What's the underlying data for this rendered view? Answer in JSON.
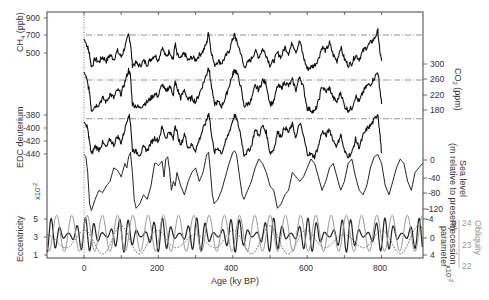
{
  "chart_data": {
    "type": "line",
    "title": "",
    "xlabel": "Age (ky BP)",
    "xlim": [
      -100,
      910
    ],
    "xticks": [
      0,
      200,
      400,
      600,
      800
    ],
    "x_minor_ticks": [
      100,
      300,
      500,
      700
    ],
    "grid": false,
    "panels": [
      {
        "name": "CH4",
        "ylabel": "CH4 (ppb)",
        "axis_side": "left",
        "yticks": [
          500,
          700,
          900
        ],
        "ylim": [
          350,
          950
        ],
        "reference_line": 720,
        "series": [
          {
            "name": "CH4",
            "color": "#111111",
            "x": [
              0,
              5,
              10,
              15,
              20,
              30,
              40,
              50,
              60,
              70,
              80,
              90,
              100,
              110,
              120,
              125,
              130,
              140,
              150,
              160,
              170,
              180,
              190,
              200,
              210,
              220,
              230,
              240,
              245,
              250,
              260,
              270,
              280,
              290,
              300,
              310,
              320,
              330,
              335,
              340,
              350,
              360,
              370,
              380,
              390,
              400,
              405,
              410,
              420,
              430,
              440,
              450,
              460,
              470,
              480,
              490,
              500,
              510,
              520,
              530,
              540,
              550,
              560,
              570,
              580,
              590,
              600,
              610,
              620,
              630,
              640,
              650,
              660,
              670,
              680,
              690,
              700,
              710,
              720,
              730,
              740,
              750,
              760,
              770,
              780,
              790,
              795,
              800
            ],
            "values": [
              680,
              640,
              600,
              520,
              400,
              480,
              450,
              500,
              460,
              520,
              480,
              560,
              500,
              600,
              720,
              640,
              420,
              440,
              410,
              460,
              430,
              480,
              520,
              470,
              600,
              500,
              560,
              480,
              640,
              520,
              480,
              540,
              460,
              500,
              470,
              520,
              560,
              640,
              760,
              600,
              420,
              460,
              440,
              500,
              560,
              680,
              720,
              660,
              560,
              400,
              440,
              480,
              560,
              500,
              580,
              520,
              420,
              460,
              540,
              500,
              600,
              540,
              640,
              560,
              660,
              500,
              380,
              400,
              420,
              480,
              600,
              560,
              640,
              520,
              460,
              600,
              480,
              420,
              440,
              520,
              480,
              560,
              600,
              640,
              680,
              760,
              560,
              460
            ]
          }
        ]
      },
      {
        "name": "CO2",
        "ylabel": "CO2 (ppm)",
        "axis_side": "right",
        "yticks": [
          180,
          220,
          260,
          300
        ],
        "ylim": [
          165,
          310
        ],
        "reference_line": 260,
        "series": [
          {
            "name": "CO2",
            "color": "#111111",
            "x": [
              0,
              5,
              10,
              15,
              20,
              30,
              40,
              50,
              60,
              70,
              80,
              90,
              100,
              110,
              120,
              125,
              130,
              140,
              150,
              160,
              170,
              180,
              190,
              200,
              210,
              220,
              230,
              240,
              245,
              250,
              260,
              270,
              280,
              290,
              300,
              310,
              320,
              330,
              335,
              340,
              350,
              360,
              370,
              380,
              390,
              400,
              405,
              410,
              420,
              430,
              440,
              450,
              460,
              470,
              480,
              490,
              500,
              510,
              520,
              530,
              540,
              550,
              560,
              570,
              580,
              590,
              600,
              610,
              620,
              630,
              640,
              650,
              660,
              670,
              680,
              690,
              700,
              710,
              720,
              730,
              740,
              750,
              760,
              770,
              780,
              790,
              795,
              800
            ],
            "values": [
              280,
              270,
              250,
              230,
              185,
              195,
              200,
              215,
              205,
              225,
              215,
              235,
              225,
              255,
              285,
              270,
              200,
              195,
              190,
              200,
              205,
              215,
              225,
              220,
              250,
              230,
              245,
              225,
              255,
              240,
              215,
              235,
              210,
              215,
              205,
              225,
              250,
              275,
              295,
              260,
              200,
              205,
              195,
              215,
              245,
              275,
              285,
              280,
              250,
              195,
              200,
              210,
              245,
              235,
              260,
              250,
              200,
              205,
              245,
              240,
              255,
              245,
              260,
              235,
              270,
              240,
              190,
              185,
              180,
              205,
              245,
              230,
              240,
              215,
              205,
              230,
              195,
              185,
              190,
              220,
              205,
              230,
              245,
              250,
              265,
              280,
              240,
              200
            ]
          }
        ]
      },
      {
        "name": "EDC deuterium",
        "ylabel": "EDC deuterium",
        "axis_side": "left",
        "yticks": [
          -440,
          -420,
          -400,
          -380
        ],
        "ylim": [
          -450,
          -370
        ],
        "reference_line": -390,
        "series": [
          {
            "name": "dD",
            "color": "#111111",
            "x": [
              0,
              5,
              10,
              15,
              20,
              30,
              40,
              50,
              60,
              70,
              80,
              90,
              100,
              110,
              120,
              125,
              130,
              140,
              150,
              160,
              170,
              180,
              190,
              200,
              210,
              220,
              230,
              240,
              245,
              250,
              260,
              270,
              280,
              290,
              300,
              310,
              320,
              330,
              335,
              340,
              350,
              360,
              370,
              380,
              390,
              400,
              405,
              410,
              420,
              430,
              440,
              450,
              460,
              470,
              480,
              490,
              500,
              510,
              520,
              530,
              540,
              550,
              560,
              570,
              580,
              590,
              600,
              610,
              620,
              630,
              640,
              650,
              660,
              670,
              680,
              690,
              700,
              710,
              720,
              730,
              740,
              750,
              760,
              770,
              780,
              790,
              795,
              800
            ],
            "values": [
              -395,
              -398,
              -405,
              -425,
              -442,
              -430,
              -435,
              -425,
              -432,
              -420,
              -428,
              -415,
              -425,
              -405,
              -383,
              -395,
              -435,
              -438,
              -442,
              -432,
              -436,
              -425,
              -418,
              -422,
              -402,
              -418,
              -408,
              -420,
              -398,
              -410,
              -430,
              -412,
              -432,
              -428,
              -436,
              -420,
              -405,
              -392,
              -380,
              -400,
              -440,
              -432,
              -440,
              -425,
              -410,
              -392,
              -385,
              -390,
              -410,
              -442,
              -438,
              -430,
              -405,
              -415,
              -400,
              -410,
              -440,
              -435,
              -410,
              -415,
              -402,
              -410,
              -398,
              -418,
              -395,
              -415,
              -440,
              -442,
              -445,
              -430,
              -408,
              -415,
              -405,
              -422,
              -430,
              -412,
              -438,
              -444,
              -440,
              -420,
              -432,
              -415,
              -405,
              -400,
              -392,
              -382,
              -410,
              -440
            ]
          }
        ]
      },
      {
        "name": "Sea level",
        "ylabel": "Sea level (m relative to present)",
        "axis_side": "right",
        "yticks": [
          -120,
          -80,
          -40,
          0
        ],
        "ylim": [
          -135,
          10
        ],
        "series": [
          {
            "name": "Sea level",
            "color": "#222222",
            "x": [
              0,
              5,
              10,
              15,
              20,
              30,
              40,
              50,
              60,
              70,
              80,
              90,
              100,
              110,
              115,
              120,
              125,
              130,
              135,
              140,
              150,
              160,
              170,
              180,
              190,
              195,
              200,
              210,
              215,
              220,
              225,
              230,
              235,
              240,
              245,
              250,
              260,
              270,
              280,
              290,
              300,
              310,
              320,
              325,
              330,
              335,
              340,
              345,
              350,
              360,
              370,
              380,
              390,
              400,
              405,
              410,
              415,
              420,
              425,
              430,
              440,
              450,
              460,
              470,
              480,
              490,
              500,
              510,
              520,
              530,
              540,
              550,
              560,
              570,
              580,
              590,
              600,
              610,
              620,
              630,
              640,
              650,
              660,
              670,
              680,
              690,
              700,
              710,
              720,
              730,
              740,
              750,
              760,
              770,
              780,
              790,
              800,
              810,
              820,
              830,
              840,
              850,
              860,
              870,
              880,
              890,
              900,
              910
            ],
            "values": [
              0,
              -5,
              -40,
              -110,
              -125,
              -100,
              -80,
              -85,
              -70,
              -60,
              -30,
              -35,
              -50,
              -20,
              -30,
              -5,
              5,
              -40,
              -100,
              -120,
              -110,
              -90,
              -100,
              -70,
              -20,
              -20,
              -25,
              -15,
              -50,
              -10,
              -5,
              -35,
              -80,
              -60,
              -70,
              -40,
              -70,
              -90,
              -60,
              -40,
              -30,
              -60,
              -40,
              -20,
              0,
              5,
              -40,
              -90,
              -110,
              -100,
              -80,
              -50,
              -20,
              5,
              8,
              0,
              -30,
              -60,
              -90,
              -100,
              -80,
              -60,
              -30,
              -10,
              -20,
              -40,
              -70,
              -80,
              -120,
              -110,
              -90,
              -80,
              -40,
              -50,
              -60,
              -50,
              -30,
              -10,
              -20,
              -50,
              -80,
              -60,
              -30,
              -20,
              -50,
              -80,
              -60,
              -20,
              -10,
              -50,
              -80,
              -90,
              -70,
              -30,
              -5,
              0,
              -20,
              -70,
              -90,
              -60,
              -30,
              -10,
              -20,
              -60,
              -80,
              -40,
              -30,
              -20
            ]
          }
        ]
      },
      {
        "name": "Orbital parameters",
        "axis_side": "both",
        "axes": [
          {
            "ylabel": "Eccentricity",
            "unit": "x10^-2",
            "side": "left",
            "yticks": [
              1,
              3,
              5
            ],
            "ylim": [
              0.5,
              5.5
            ],
            "color": "#555555",
            "style": "dotted"
          },
          {
            "ylabel": "Precession parameter",
            "unit": "x10^-2",
            "side": "right-inner",
            "yticks": [
              -4,
              0,
              4
            ],
            "ylim": [
              -6,
              6
            ],
            "color": "#222222",
            "style": "solid"
          },
          {
            "ylabel": "Obliquity",
            "side": "right-outer",
            "yticks": [
              22,
              23,
              24
            ],
            "ylim": [
              21.8,
              24.6
            ],
            "color": "#999999",
            "style": "solid"
          }
        ],
        "series": [
          {
            "name": "Eccentricity",
            "color": "#555555",
            "style": "dotted",
            "period": 100,
            "amplitude": 1.6,
            "offset": 2.4
          },
          {
            "name": "Precession",
            "color": "#222222",
            "style": "solid",
            "period": 23,
            "amplitude": 4.5,
            "offset": 0
          },
          {
            "name": "Obliquity",
            "color": "#999999",
            "style": "solid",
            "period": 41,
            "amplitude": 1.1,
            "offset": 23.3
          }
        ]
      }
    ]
  },
  "labels": {
    "ch4": "CH",
    "ch4_sub": "4",
    "ch4_unit": "(ppb)",
    "co2": "CO",
    "co2_sub": "2",
    "co2_unit": "(ppm)",
    "edc": "EDC deuterium",
    "sea_level_1": "Sea level",
    "sea_level_2": "(m relative to present)",
    "eccentricity": "Eccentricity",
    "precession": "Precession",
    "parameter": "parameter",
    "obliquity": "Obliquity",
    "x10_left": "x10",
    "x10_right": "x10",
    "x10_exp": "-2",
    "xlabel": "Age (ky BP)"
  },
  "ticks": {
    "ch4": [
      "900",
      "700",
      "500"
    ],
    "co2": [
      "300",
      "260",
      "220",
      "180"
    ],
    "edc": [
      "-380",
      "-400",
      "-420",
      "-440"
    ],
    "sea": [
      "0",
      "-40",
      "-80",
      "-120"
    ],
    "ecc": [
      "5",
      "3",
      "1"
    ],
    "prec": [
      "-4",
      "0",
      "4"
    ],
    "obl": [
      "24",
      "23",
      "22"
    ],
    "x": [
      "0",
      "200",
      "400",
      "600",
      "800"
    ]
  }
}
